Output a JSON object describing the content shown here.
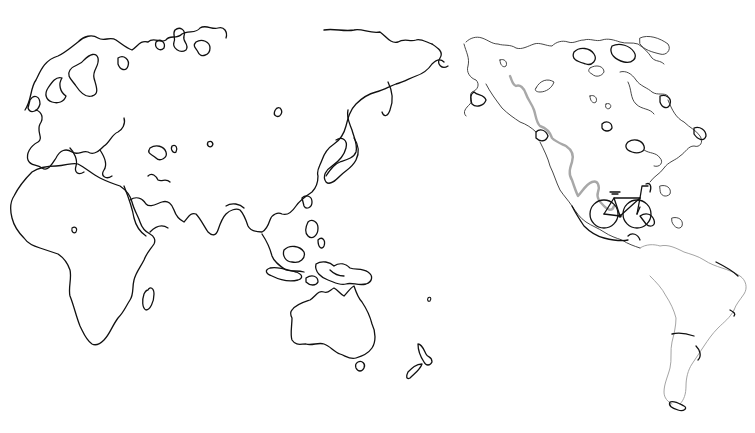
{
  "map": {
    "style": "hand-drawn world map outline, Pacific-centered",
    "background_color": "#ffffff",
    "coast_color": "#111111",
    "regions": [
      {
        "name": "Europe"
      },
      {
        "name": "Africa"
      },
      {
        "name": "Asia"
      },
      {
        "name": "Southeast Asia"
      },
      {
        "name": "Australia"
      },
      {
        "name": "New Zealand"
      },
      {
        "name": "North America"
      },
      {
        "name": "South America"
      }
    ],
    "route": {
      "color": "#a8a8a8",
      "description": "cycling route along the western coast of North America"
    },
    "marker": {
      "icon": "bicycle-icon",
      "location": "Mexico / Central America"
    }
  }
}
